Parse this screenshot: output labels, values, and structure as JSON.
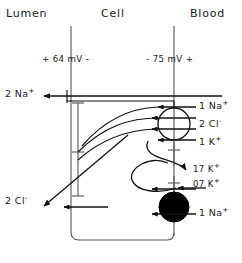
{
  "figure": {
    "type": "cell-transport-diagram",
    "headers": [
      {
        "id": "lumen",
        "label": "Lumen"
      },
      {
        "id": "cell",
        "label": "Cell"
      },
      {
        "id": "blood",
        "label": "Blood"
      }
    ],
    "potentials": [
      {
        "id": "apical",
        "label": "+ 64 mV -"
      },
      {
        "id": "basolateral",
        "label": "- 75 mV +"
      }
    ],
    "transport_labels": [
      {
        "id": "lumen-na",
        "ion": "2 Na",
        "charge": "+",
        "side": "left",
        "y": 95
      },
      {
        "id": "lumen-cl",
        "ion": "2 Cl",
        "charge": "-",
        "side": "left",
        "y": 201
      },
      {
        "id": "cotransport-na",
        "ion": "1 Na",
        "charge": "+",
        "side": "right",
        "y": 106
      },
      {
        "id": "cotransport-cl",
        "ion": "2 Cl",
        "charge": "-",
        "side": "right",
        "y": 124
      },
      {
        "id": "cotransport-k",
        "ion": "1 K",
        "charge": "+",
        "side": "right",
        "y": 142
      },
      {
        "id": "pump-k-out",
        "ion": "17 K",
        "charge": "+",
        "side": "right",
        "y": 168
      },
      {
        "id": "pump-k-in",
        "ion": "07 K",
        "charge": "+",
        "side": "right",
        "y": 183
      },
      {
        "id": "pump-na",
        "ion": "1 Na",
        "charge": "+",
        "side": "right",
        "y": 213
      }
    ],
    "structures": [
      {
        "id": "cotransporter",
        "shape": "open-circle",
        "fill": "none"
      },
      {
        "id": "atpase-pump",
        "shape": "filled-circle",
        "fill": "#000000"
      }
    ],
    "colors": {
      "ink": "#111111",
      "background": "#ffffff",
      "pump_fill": "#000000"
    }
  }
}
